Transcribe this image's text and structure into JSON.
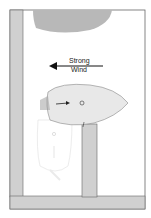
{
  "diagram": {
    "wind_label_line1": "Strong",
    "wind_label_line2": "Wind",
    "colors": {
      "frame": "#555555",
      "pier": "#cfcfcf",
      "boat_fill": "#e6e6e6",
      "other_boat": "#b5b5b5",
      "ghost": "#d9d9d9"
    }
  }
}
